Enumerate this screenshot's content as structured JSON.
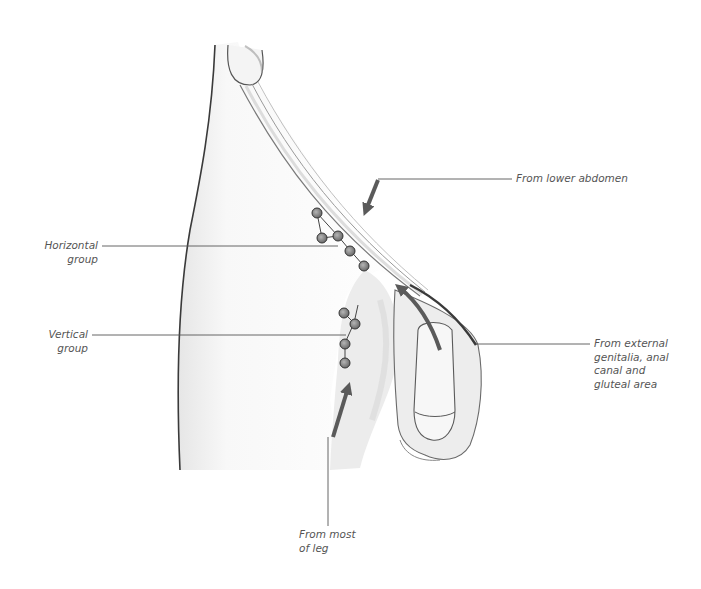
{
  "diagram": {
    "labels": {
      "from_lower_abdomen": "From lower abdomen",
      "horizontal_group": "Horizontal\ngroup",
      "vertical_group": "Vertical\ngroup",
      "from_external_genitalia": "From external\ngenitalia, anal\ncanal and\ngluteal area",
      "from_most_of_leg": "From most\nof leg"
    },
    "colors": {
      "arrow": "#5a5a5a",
      "leader_line": "#555555",
      "outline": "#3a3a3a",
      "node_fill": "#8a8a8a",
      "text": "#555555"
    }
  }
}
